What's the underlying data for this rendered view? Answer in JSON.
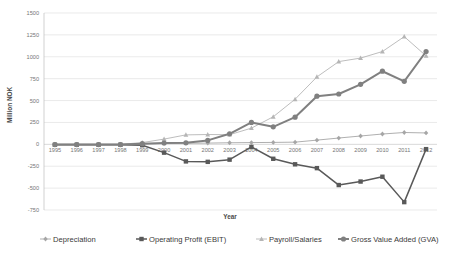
{
  "chart_data": {
    "type": "line",
    "title": "",
    "xlabel": "Year",
    "ylabel": "Million NOK",
    "grid": true,
    "legend_position": "bottom",
    "categories": [
      1995,
      1996,
      1997,
      1998,
      1999,
      2000,
      2001,
      2002,
      2003,
      2004,
      2005,
      2006,
      2007,
      2008,
      2009,
      2010,
      2011,
      2012
    ],
    "x_tick_labels": [
      "1995",
      "1996",
      "1997",
      "1998",
      "1999",
      "2000",
      "2001",
      "2002",
      "2003",
      "2004",
      "2005",
      "2006",
      "2007",
      "2008",
      "2009",
      "2010",
      "2011",
      "2012"
    ],
    "ylim": [
      -750,
      1500
    ],
    "y_ticks": [
      1500,
      1250,
      1000,
      750,
      500,
      250,
      0,
      -250,
      -500,
      -750
    ],
    "y_tick_labels": [
      "1500",
      "1250",
      "1000",
      "750",
      "500",
      "250",
      "0",
      "-250",
      "-500",
      "-750"
    ],
    "series": [
      {
        "name": "Depreciation",
        "color": "#a6a6a6",
        "marker": "diamond",
        "line_width": 0.9,
        "values": [
          0,
          0,
          0,
          0,
          5,
          10,
          12,
          14,
          18,
          20,
          22,
          25,
          48,
          72,
          95,
          118,
          135,
          130
        ]
      },
      {
        "name": "Operating Profit (EBIT)",
        "color": "#595959",
        "marker": "square",
        "line_width": 1.5,
        "values": [
          -5,
          -5,
          -5,
          -5,
          -10,
          -95,
          -195,
          -200,
          -175,
          -30,
          -165,
          -228,
          -272,
          -465,
          -425,
          -370,
          -660,
          -55
        ]
      },
      {
        "name": "Payroll/Salaries",
        "color": "#b5b5b5",
        "marker": "triangle",
        "line_width": 0.9,
        "values": [
          0,
          0,
          0,
          0,
          20,
          60,
          108,
          112,
          110,
          185,
          315,
          515,
          770,
          945,
          985,
          1060,
          1230,
          1010
        ]
      },
      {
        "name": "Gross Value Added (GVA)",
        "color": "#808080",
        "marker": "circle",
        "line_width": 2.0,
        "values": [
          -3,
          -3,
          -3,
          -3,
          8,
          15,
          18,
          45,
          120,
          250,
          200,
          310,
          550,
          575,
          685,
          835,
          720,
          1060
        ]
      }
    ]
  },
  "legend": {
    "items": [
      {
        "label": "Depreciation"
      },
      {
        "label": "Operating Profit (EBIT)"
      },
      {
        "label": "Payroll/Salaries"
      },
      {
        "label": "Gross Value Added (GVA)"
      }
    ]
  }
}
